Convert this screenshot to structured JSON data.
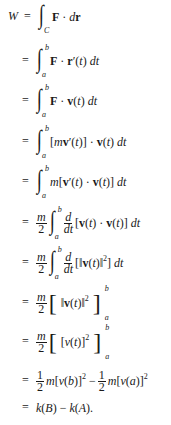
{
  "derivation": {
    "lhs": "W",
    "equals": "=",
    "lines": [
      {
        "integral": {
          "upper": "",
          "lower": "C"
        },
        "expr": "F · dr"
      },
      {
        "integral": {
          "upper": "b",
          "lower": "a"
        },
        "expr": "F · r′(t) dt"
      },
      {
        "integral": {
          "upper": "b",
          "lower": "a"
        },
        "expr": "F · v(t) dt"
      },
      {
        "integral": {
          "upper": "b",
          "lower": "a"
        },
        "expr": "[mv′(t)] · v(t) dt"
      },
      {
        "integral": {
          "upper": "b",
          "lower": "a"
        },
        "expr": "m[v′(t) · v(t)] dt"
      },
      {
        "prefix": "m/2",
        "integral": {
          "upper": "b",
          "lower": "a"
        },
        "expr": "d/dt[v(t) · v(t)] dt"
      },
      {
        "prefix": "m/2",
        "integral": {
          "upper": "b",
          "lower": "a"
        },
        "expr": "d/dt[‖v(t)‖²] dt"
      },
      {
        "prefix": "m/2",
        "bracket": {
          "upper": "b",
          "lower": "a"
        },
        "expr": "‖v(t)‖²"
      },
      {
        "prefix": "m/2",
        "bracket": {
          "upper": "b",
          "lower": "a"
        },
        "expr": "[v(t)]²"
      },
      {
        "expr": "½m[v(b)]² − ½m[v(a)]²"
      },
      {
        "expr": "k(B) − k(A)."
      }
    ],
    "labels": {
      "m": "m",
      "two": "2",
      "one": "1",
      "d": "d",
      "dt": "dt",
      "C": "C",
      "a": "a",
      "b": "b"
    }
  }
}
